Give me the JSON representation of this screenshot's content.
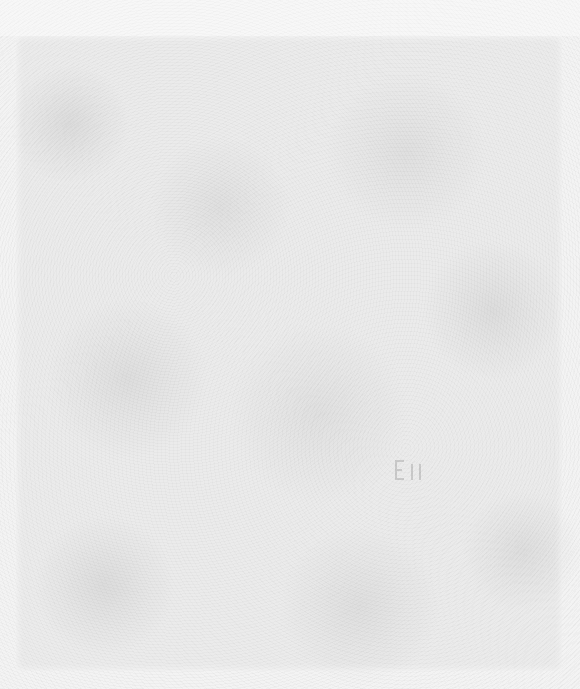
{
  "page": {
    "background_color": "#f3f3f3",
    "texture_tone": "#9a9a9a"
  },
  "content": {
    "text_items": []
  }
}
